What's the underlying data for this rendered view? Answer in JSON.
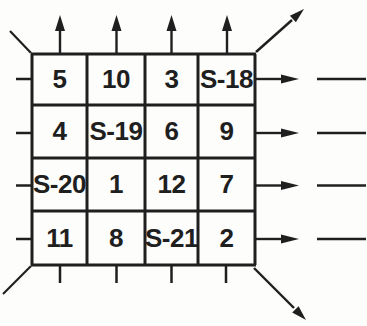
{
  "diagram": {
    "colors": {
      "ink": "#1f1f1f",
      "background": "#fdfdfc"
    },
    "grid": {
      "rows": [
        [
          "5",
          "10",
          "3",
          "S-18"
        ],
        [
          "4",
          "S-19",
          "6",
          "9"
        ],
        [
          "S-20",
          "1",
          "12",
          "7"
        ],
        [
          "11",
          "8",
          "S-21",
          "2"
        ]
      ]
    }
  }
}
